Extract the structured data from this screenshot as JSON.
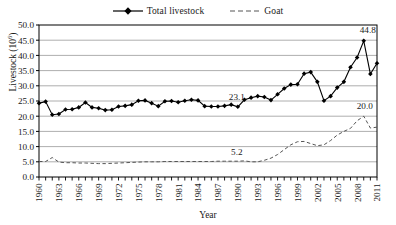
{
  "chart_data": {
    "type": "line",
    "title": "",
    "xlabel": "Year",
    "ylabel": "Livestock (10",
    "ylabel_exponent": "6",
    "ylabel_ylabel_suffix": ")",
    "xlim": [
      1960,
      2011
    ],
    "ylim": [
      0.0,
      50.0
    ],
    "ytick_step": 5.0,
    "xtick_step": 1,
    "xtick_label_step": 3,
    "grid": "horizontal",
    "legend_position": "top-center",
    "ytick_labels": [
      "0.0",
      "5.0",
      "10.0",
      "15.0",
      "20.0",
      "25.0",
      "30.0",
      "35.0",
      "40.0",
      "45.0",
      "50.0"
    ],
    "ytick_values": [
      0,
      5,
      10,
      15,
      20,
      25,
      30,
      35,
      40,
      45,
      50
    ],
    "xtick_labels": [
      "1960",
      "1963",
      "1966",
      "1969",
      "1972",
      "1975",
      "1978",
      "1981",
      "1984",
      "1987",
      "1990",
      "1993",
      "1996",
      "1999",
      "2002",
      "2005",
      "2008",
      "2011"
    ],
    "x": [
      1960,
      1961,
      1962,
      1963,
      1964,
      1965,
      1966,
      1967,
      1968,
      1969,
      1970,
      1971,
      1972,
      1973,
      1974,
      1975,
      1976,
      1977,
      1978,
      1979,
      1980,
      1981,
      1982,
      1983,
      1984,
      1985,
      1986,
      1987,
      1988,
      1989,
      1990,
      1991,
      1992,
      1993,
      1994,
      1995,
      1996,
      1997,
      1998,
      1999,
      2000,
      2001,
      2002,
      2003,
      2004,
      2005,
      2006,
      2007,
      2008,
      2009,
      2010,
      2011
    ],
    "series": [
      {
        "name": "Total livestock",
        "style": "solid-diamond-marker",
        "color": "#000000",
        "values": [
          24.3,
          24.8,
          20.5,
          20.7,
          22.2,
          22.3,
          22.9,
          24.5,
          22.9,
          22.6,
          22.0,
          22.1,
          23.2,
          23.4,
          23.8,
          25.1,
          25.2,
          24.3,
          23.3,
          24.9,
          25.0,
          24.6,
          25.1,
          25.4,
          25.2,
          23.3,
          23.2,
          23.2,
          23.4,
          23.8,
          23.1,
          25.4,
          26.1,
          26.6,
          26.3,
          25.3,
          27.2,
          29.1,
          30.4,
          30.5,
          34.0,
          34.5,
          31.3,
          25.1,
          26.6,
          29.4,
          31.3,
          36.1,
          39.3,
          44.8,
          33.9,
          37.4
        ]
      },
      {
        "name": "Goat",
        "style": "dashed",
        "color": "#555555",
        "values": [
          5.1,
          5.1,
          6.4,
          4.9,
          4.7,
          4.7,
          4.6,
          4.6,
          4.5,
          4.4,
          4.4,
          4.5,
          4.6,
          4.7,
          4.8,
          4.9,
          5.0,
          5.0,
          5.0,
          5.1,
          5.1,
          5.1,
          5.1,
          5.1,
          5.1,
          5.1,
          5.1,
          5.2,
          5.2,
          5.2,
          5.2,
          5.3,
          5.0,
          5.0,
          5.5,
          6.2,
          7.4,
          9.0,
          10.6,
          11.6,
          11.7,
          11.0,
          10.3,
          10.6,
          12.0,
          13.8,
          15.0,
          16.0,
          18.5,
          20.0,
          16.1,
          16.4
        ]
      }
    ],
    "annotations": [
      {
        "label": "23.1",
        "x": 1990,
        "y": 23.1,
        "series": "Total livestock"
      },
      {
        "label": "44.8",
        "x": 2009,
        "y": 44.8,
        "series": "Total livestock"
      },
      {
        "label": "5.2",
        "x": 1990,
        "y": 5.2,
        "series": "Goat"
      },
      {
        "label": "20.0",
        "x": 2009,
        "y": 20.0,
        "series": "Goat"
      }
    ]
  },
  "legend": {
    "items": [
      {
        "label": "Total livestock",
        "key": "line-with-diamond-marker"
      },
      {
        "label": "Goat",
        "key": "dashed-line"
      }
    ]
  },
  "axes": {
    "x_title": "Year",
    "y_title_main": "Livestock (10",
    "y_title_sup": "6",
    "y_title_end": ")"
  }
}
